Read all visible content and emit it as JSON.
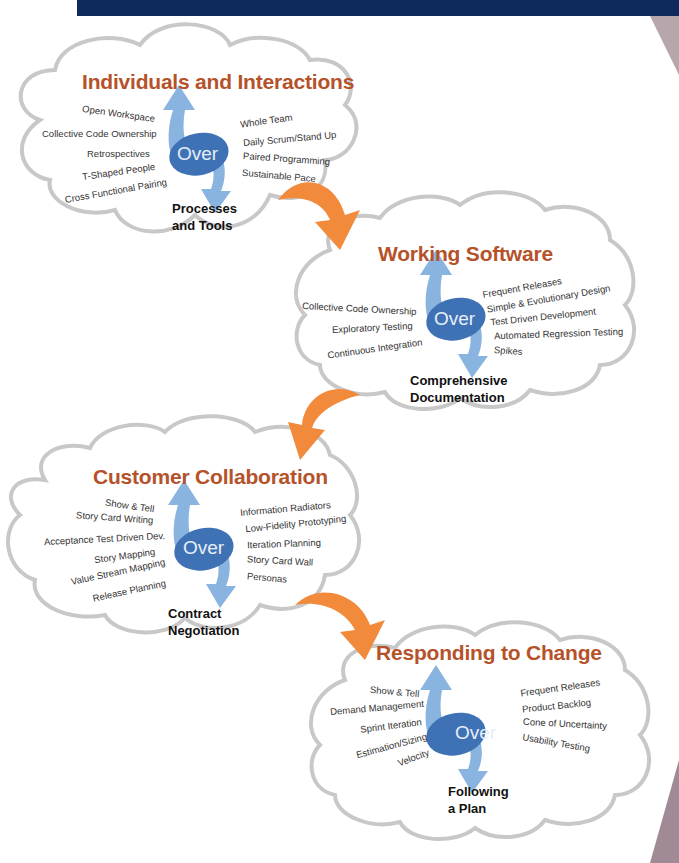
{
  "banner": {
    "color": "#0e2a5c"
  },
  "colors": {
    "title": "#b5522a",
    "arrow_orange": "#f28a3c",
    "arrow_blue": "#8ab4e0",
    "oval": "#3f72b5",
    "cloud_stroke": "#c8c8c8"
  },
  "over_label": "Over",
  "clouds": [
    {
      "title": "Individuals and Interactions",
      "left_items": [
        "Open Workspace",
        "Collective Code Ownership",
        "Retrospectives",
        "T-Shaped People",
        "Cross Functional Pairing"
      ],
      "right_items": [
        "Whole Team",
        "Daily Scrum/Stand Up",
        "Paired Programming",
        "Sustainable Pace"
      ],
      "over": "Over",
      "versus": "Processes and Tools"
    },
    {
      "title": "Working Software",
      "left_items": [
        "Collective Code Ownership",
        "Exploratory Testing",
        "Continuous Integration"
      ],
      "right_items": [
        "Frequent Releases",
        "Simple & Evolutionary Design",
        "Test Driven Development",
        "Automated Regression Testing",
        "Spikes"
      ],
      "over": "Over",
      "versus": "Comprehensive Documentation"
    },
    {
      "title": "Customer Collaboration",
      "left_items": [
        "Show & Tell",
        "Story Card Writing",
        "Acceptance Test Driven Dev.",
        "Story Mapping",
        "Value Stream Mapping",
        "Release Planning"
      ],
      "right_items": [
        "Information Radiators",
        "Low-Fidelity Prototyping",
        "Iteration Planning",
        "Story Card Wall",
        "Personas"
      ],
      "over": "Over",
      "versus": "Contract Negotiation"
    },
    {
      "title": "Responding to Change",
      "left_items": [
        "Show & Tell",
        "Demand Management",
        "Sprint Iteration",
        "Estimation/Sizing",
        "Velocity"
      ],
      "right_items": [
        "Frequent Releases",
        "Product Backlog",
        "Cone of Uncertainty",
        "Usability Testing"
      ],
      "over": "Over",
      "versus": "Following a Plan"
    }
  ]
}
